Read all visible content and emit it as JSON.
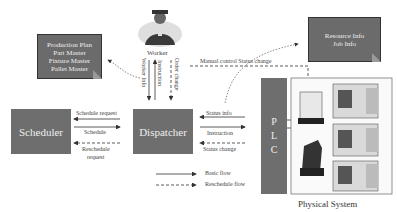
{
  "worker": {
    "label": "Worker"
  },
  "master_note": {
    "lines": [
      "Production Plan",
      "Part Master",
      "Fixture Master",
      "Pallet Master"
    ]
  },
  "resource_note": {
    "lines": [
      "Resource Info",
      "Job Info"
    ]
  },
  "blocks": {
    "scheduler": "Scheduler",
    "dispatcher": "Dispatcher",
    "plc": [
      "P",
      "L",
      "C"
    ]
  },
  "arrows": {
    "schedule_request": "Schedule request",
    "schedule": "Schedule",
    "reschedule_request_line1": "Reschedule",
    "reschedule_request_line2": "request",
    "status_info": "Status info",
    "instruction": "Instruction",
    "status_change": "Status change",
    "worker_info": "Worker Info",
    "worker_instruction": "Instruction",
    "order_change": "Order change",
    "manual_control": "Manual control Status change"
  },
  "legend": {
    "basic_flow": "Basic flow",
    "reschedule_flow": "Reschedule flow"
  },
  "physical_system": {
    "label": "Physical System"
  }
}
